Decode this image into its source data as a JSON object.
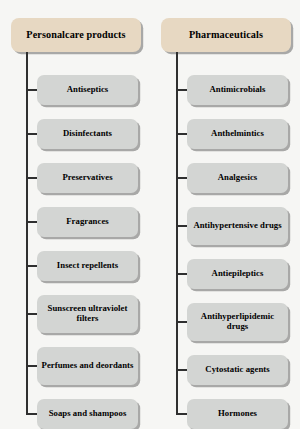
{
  "figure": {
    "type": "tree-diagram",
    "orientation": "two-column-vertical-tree",
    "background_color": "#f6f6f4",
    "root_fill_color": "#e7d8c2",
    "child_fill_color": "#d3d5d3",
    "border_color": "#2b2b2b"
  },
  "columns": [
    {
      "id": "personalcare",
      "root": {
        "label": "Personalcare products"
      },
      "children": [
        {
          "label": "Antiseptics",
          "lines": 1
        },
        {
          "label": "Disinfectants",
          "lines": 1
        },
        {
          "label": "Preservatives",
          "lines": 1
        },
        {
          "label": "Fragrances",
          "lines": 1
        },
        {
          "label": "Insect repellents",
          "lines": 1
        },
        {
          "label": "Sunscreen ultraviolet filters",
          "lines": 2
        },
        {
          "label": "Perfumes and deordants",
          "lines": 2
        },
        {
          "label": "Soaps and shampoos",
          "lines": 1
        }
      ]
    },
    {
      "id": "pharmaceuticals",
      "root": {
        "label": "Pharmaceuticals"
      },
      "children": [
        {
          "label": "Antimicrobials",
          "lines": 1
        },
        {
          "label": "Anthelmintics",
          "lines": 1
        },
        {
          "label": "Analgesics",
          "lines": 1
        },
        {
          "label": "Antihypertensive drugs",
          "lines": 2
        },
        {
          "label": "Antiepileptics",
          "lines": 1
        },
        {
          "label": "Antihyperlipidemic drugs",
          "lines": 2
        },
        {
          "label": "Cytostatic agents",
          "lines": 1
        },
        {
          "label": "Hormones",
          "lines": 1
        }
      ]
    }
  ]
}
